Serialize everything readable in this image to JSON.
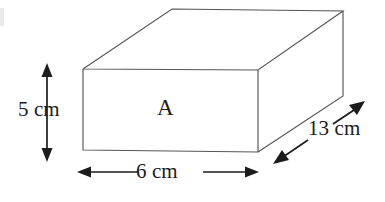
{
  "figure": {
    "name": "cuboid-diagram",
    "shape": "rectangular-prism",
    "face_label": "A",
    "background_color": "#ffffff",
    "edge_color": "#565656",
    "dimension_color": "#1c1c1c",
    "dimensions": {
      "height": {
        "label": "5 cm",
        "value": 5,
        "unit": "cm",
        "orientation": "vertical",
        "arrow": "double-headed"
      },
      "width": {
        "label": "6 cm",
        "value": 6,
        "unit": "cm",
        "orientation": "horizontal",
        "arrow": "double-headed"
      },
      "depth": {
        "label": "13 cm",
        "value": 13,
        "unit": "cm",
        "orientation": "diagonal",
        "arrow": "double-headed"
      }
    }
  }
}
